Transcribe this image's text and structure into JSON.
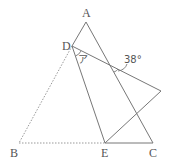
{
  "diagram": {
    "points": {
      "A": {
        "label": "A"
      },
      "B": {
        "label": "B"
      },
      "C": {
        "label": "C"
      },
      "D": {
        "label": "D"
      },
      "E": {
        "label": "E"
      }
    },
    "angles": {
      "unknown": {
        "label": "ア",
        "description": "angle at D between DE and the folded edge"
      },
      "given": {
        "label": "38°",
        "description": "angle where folded edge crosses side AC"
      }
    },
    "edges": [
      {
        "from": "A",
        "to": "C",
        "style": "solid"
      },
      {
        "from": "A",
        "to": "D",
        "style": "solid"
      },
      {
        "from": "D",
        "to": "E",
        "style": "solid"
      },
      {
        "from": "E",
        "to": "C",
        "style": "solid"
      },
      {
        "from": "D",
        "to": "B'",
        "style": "solid"
      },
      {
        "from": "E",
        "to": "B'",
        "style": "solid"
      },
      {
        "from": "D",
        "to": "B",
        "style": "dashed"
      },
      {
        "from": "B",
        "to": "E",
        "style": "dashed"
      }
    ]
  }
}
